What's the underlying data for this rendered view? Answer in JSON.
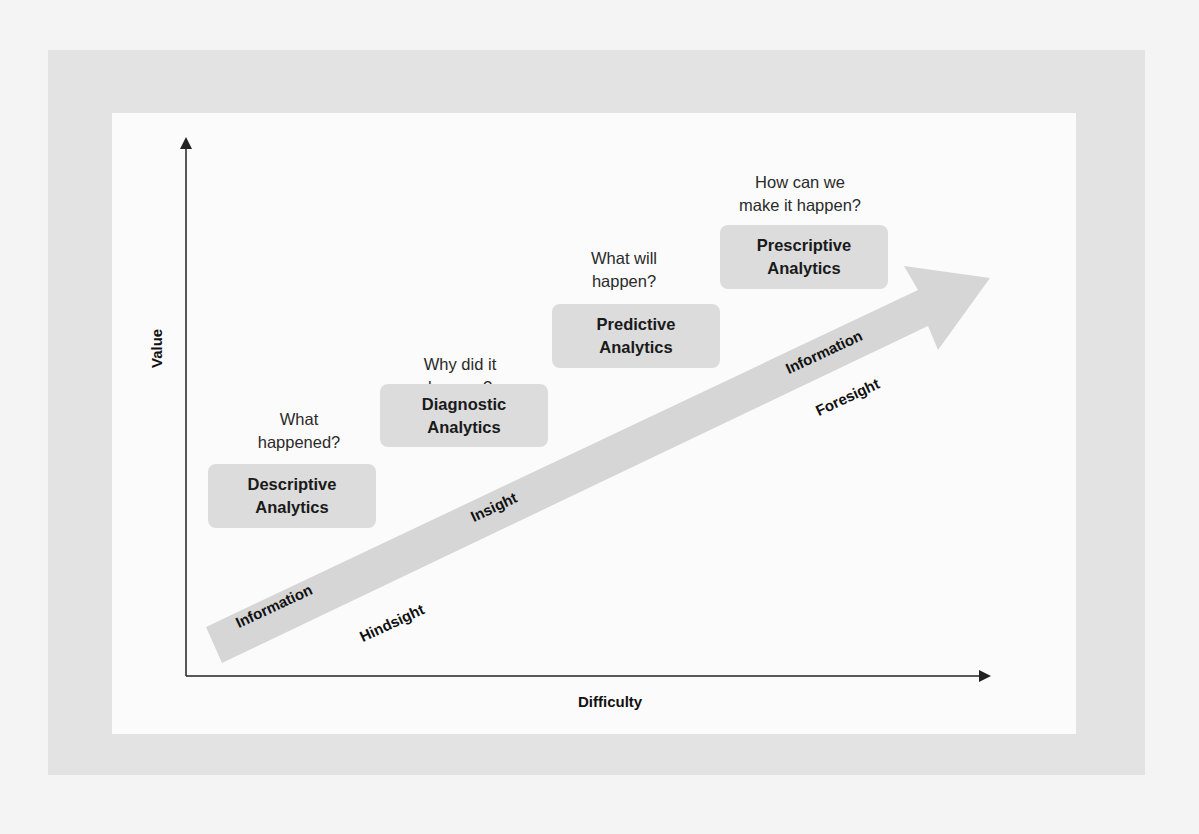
{
  "diagram": {
    "axes": {
      "x_label": "Difficulty",
      "y_label": "Value"
    },
    "stages": [
      {
        "title": "Descriptive Analytics",
        "title_lines": [
          "Descriptive",
          "Analytics"
        ],
        "question_lines": [
          "What",
          "happened?"
        ]
      },
      {
        "title": "Diagnostic Analytics",
        "title_lines": [
          "Diagnostic",
          "Analytics"
        ],
        "question_lines": [
          "Why did it",
          "happen?"
        ]
      },
      {
        "title": "Predictive Analytics",
        "title_lines": [
          "Predictive",
          "Analytics"
        ],
        "question_lines": [
          "What will",
          "happen?"
        ]
      },
      {
        "title": "Prescriptive Analytics",
        "title_lines": [
          "Prescriptive",
          "Analytics"
        ],
        "question_lines": [
          "How can we",
          "make it happen?"
        ]
      }
    ],
    "arrow_labels": {
      "start_on_arrow": "Information",
      "end_on_arrow": "Information",
      "below": [
        "Hindsight",
        "Insight",
        "Foresight"
      ]
    },
    "colors": {
      "arrow": "#d6d6d6",
      "box": "#dcdcdc",
      "axis": "#222222"
    }
  }
}
